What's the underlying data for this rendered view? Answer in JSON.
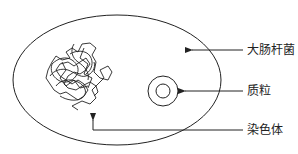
{
  "diagram": {
    "type": "labeled-schematic",
    "colors": {
      "stroke": "#222222",
      "background": "#ffffff",
      "text": "#222222"
    },
    "labels": {
      "cell": "大肠杆菌",
      "plasmid": "质粒",
      "chromosome": "染色体"
    },
    "components": [
      {
        "id": "cell",
        "shape": "ellipse",
        "label": "大肠杆菌"
      },
      {
        "id": "plasmid",
        "shape": "double-circle",
        "label": "质粒"
      },
      {
        "id": "chromosome",
        "shape": "tangled-coil",
        "label": "染色体"
      }
    ],
    "arrows": [
      {
        "from": "大肠杆菌",
        "to": "cell",
        "direction": "left"
      },
      {
        "from": "质粒",
        "to": "plasmid",
        "direction": "left"
      },
      {
        "from": "染色体",
        "to": "chromosome",
        "direction": "up"
      }
    ]
  }
}
